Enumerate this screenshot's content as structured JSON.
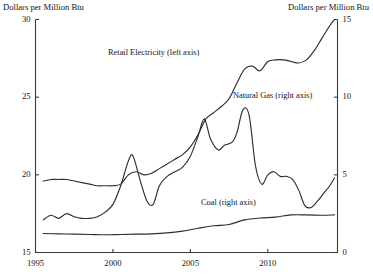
{
  "chart_data": {
    "type": "line",
    "title": "",
    "xlabel": "",
    "ylabel": "Dollars per Million Btu",
    "y2label": "Dollars per Million Btu",
    "grid": false,
    "legend_position": "inline-annotations",
    "xlim": [
      1995,
      2014.5
    ],
    "ylim": [
      15,
      30
    ],
    "y2lim": [
      0,
      15
    ],
    "xticks": [
      "1995",
      "2000",
      "2005",
      "2010"
    ],
    "xtick_values": [
      1995,
      2000,
      2005,
      2010
    ],
    "yticks": [
      "15",
      "20",
      "25",
      "30"
    ],
    "ytick_values": [
      15,
      20,
      25,
      30
    ],
    "y2ticks": [
      "0",
      "5",
      "10",
      "15"
    ],
    "y2tick_values": [
      0,
      5,
      10,
      15
    ],
    "series": [
      {
        "name": "Retail Electricity (left axis)",
        "axis": "left",
        "x": [
          1995.5,
          1996,
          1996.5,
          1997,
          1997.5,
          1998,
          1998.5,
          1999,
          1999.5,
          2000,
          2000.5,
          2001,
          2001.5,
          2002,
          2002.5,
          2003,
          2003.5,
          2004,
          2004.5,
          2005,
          2005.5,
          2006,
          2006.5,
          2007,
          2007.5,
          2008,
          2008.5,
          2009,
          2009.5,
          2010,
          2010.5,
          2011,
          2011.5,
          2012,
          2012.5,
          2013,
          2013.5,
          2014,
          2014.3
        ],
        "y": [
          19.6,
          19.7,
          19.7,
          19.7,
          19.6,
          19.5,
          19.4,
          19.3,
          19.3,
          19.3,
          19.4,
          20.0,
          20.2,
          20.0,
          20.1,
          20.4,
          20.7,
          21.0,
          21.3,
          21.8,
          22.6,
          23.6,
          24.0,
          24.4,
          24.9,
          25.9,
          26.8,
          27.0,
          26.7,
          27.3,
          27.4,
          27.4,
          27.3,
          27.2,
          27.4,
          28.0,
          28.8,
          29.6,
          30.0
        ]
      },
      {
        "name": "Natural Gas (right axis)",
        "axis": "right",
        "x": [
          1995.5,
          1996,
          1996.5,
          1997,
          1997.5,
          1998,
          1998.5,
          1999,
          1999.5,
          2000,
          2000.5,
          2001,
          2001.3,
          2001.8,
          2002.2,
          2002.6,
          2003,
          2003.5,
          2004,
          2004.5,
          2005,
          2005.5,
          2005.9,
          2006.3,
          2006.8,
          2007.2,
          2007.7,
          2008,
          2008.4,
          2008.8,
          2009.2,
          2009.6,
          2010,
          2010.4,
          2010.8,
          2011.2,
          2011.6,
          2012,
          2012.4,
          2012.8,
          2013.2,
          2013.6,
          2014,
          2014.3
        ],
        "y": [
          2.1,
          2.4,
          2.2,
          2.5,
          2.3,
          2.2,
          2.2,
          2.3,
          2.6,
          3.1,
          4.3,
          5.9,
          6.2,
          4.5,
          3.3,
          3.1,
          4.3,
          4.9,
          5.2,
          5.5,
          6.2,
          7.5,
          8.6,
          7.3,
          6.6,
          6.9,
          7.1,
          7.7,
          9.2,
          8.8,
          5.6,
          4.4,
          5.0,
          5.2,
          4.9,
          4.9,
          4.7,
          4.0,
          3.0,
          2.9,
          3.3,
          3.8,
          4.3,
          4.8
        ]
      },
      {
        "name": "Coal (right axis)",
        "axis": "right",
        "x": [
          1995.5,
          1996.5,
          1997.5,
          1998.5,
          1999.5,
          2000.5,
          2001.5,
          2002.5,
          2003.5,
          2004.5,
          2005.5,
          2006.5,
          2007.5,
          2008.5,
          2009.5,
          2010.5,
          2011.5,
          2012.5,
          2013.5,
          2014.3
        ],
        "y": [
          1.22,
          1.2,
          1.18,
          1.16,
          1.14,
          1.16,
          1.18,
          1.2,
          1.26,
          1.38,
          1.56,
          1.72,
          1.8,
          2.1,
          2.22,
          2.28,
          2.42,
          2.42,
          2.4,
          2.42
        ]
      }
    ],
    "annotations": [
      {
        "text": "Retail Electricity (left axis)",
        "x": 2002.0,
        "y": 27.0
      },
      {
        "text": "Natural Gas (right axis)",
        "x": 2008.6,
        "y": 9.6
      },
      {
        "text": "Coal (right axis)",
        "x": 2006.8,
        "y": 3.4
      }
    ]
  },
  "axes": {
    "left_title": "Dollars per Million Btu",
    "right_title": "Dollars per Million Btu"
  },
  "colors": {
    "line": "#2e2e2e",
    "axis": "#3b3b3b",
    "text": "#141414",
    "background": "#ffffff"
  }
}
